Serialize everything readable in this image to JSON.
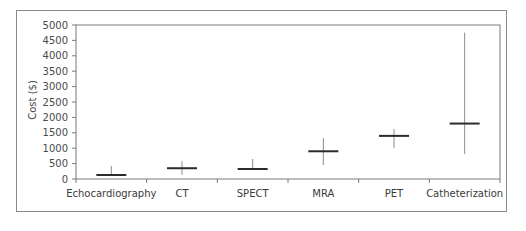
{
  "chart_data": {
    "type": "range",
    "title": "",
    "xlabel": "",
    "ylabel": "Cost ($)",
    "ylim": [
      0,
      5000
    ],
    "yticks": [
      0,
      500,
      1000,
      1500,
      2000,
      2500,
      3000,
      3500,
      4000,
      4500,
      5000
    ],
    "grid": false,
    "legend": null,
    "categories": [
      "Echocardiography",
      "CT",
      "SPECT",
      "MRA",
      "PET",
      "Catheterization"
    ],
    "series": [
      {
        "name": "central",
        "values": [
          130,
          350,
          325,
          900,
          1400,
          1800
        ]
      },
      {
        "name": "high",
        "values": [
          420,
          580,
          650,
          1330,
          1620,
          4750
        ]
      },
      {
        "name": "low",
        "values": [
          100,
          130,
          300,
          455,
          1000,
          810
        ]
      }
    ]
  },
  "colors": {
    "frame": "#8a8a8a",
    "axis": "#7a7a7a",
    "bar": "#2b2b2b",
    "whisker": "#8c8c8c"
  }
}
